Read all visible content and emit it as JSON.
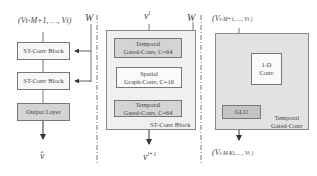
{
  "left": {
    "input_label": "(v_{t-M+1}, ..., v_t)",
    "input_display": "(Vt-M+1, …, Vt)",
    "w_label": "W",
    "blocks": [
      "ST-Conv Block",
      "ST-Conv Block",
      "Output Layer"
    ],
    "output_label": "v̂"
  },
  "middle": {
    "input_label": "v^l",
    "input_display": "v",
    "input_sup": "l",
    "w_label": "W",
    "layers": [
      {
        "line1": "Temporal",
        "line2": "Gated-Conv, C=64"
      },
      {
        "line1": "Spatial",
        "line2": "Graph-Conv, C=16"
      },
      {
        "line1": "Temporal",
        "line2": "Gated-Conv, C=64"
      }
    ],
    "container_label": "ST-Conv Block",
    "output_display": "v",
    "output_sup": "l+1"
  },
  "right": {
    "input_display": "(V",
    "input_rest": "t-M+1, …, V",
    "input_end": "t )",
    "conv_line1": "1-D",
    "conv_line2": "Conv",
    "glu_label": "GLU",
    "container_line1": "Temporal",
    "container_line2": "Gated-Conv",
    "output_display": "(V",
    "output_rest": "t-M-Kt, …, V",
    "output_end": "t )"
  }
}
